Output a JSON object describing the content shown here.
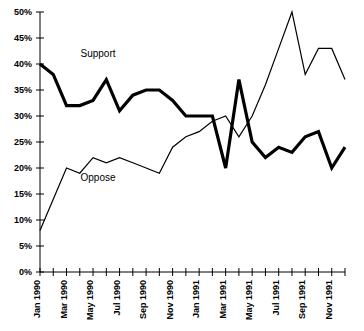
{
  "chart_data": {
    "type": "line",
    "title": "",
    "xlabel": "",
    "ylabel": "",
    "ylim": [
      0,
      50
    ],
    "ytick_values": [
      0,
      5,
      10,
      15,
      20,
      25,
      30,
      35,
      40,
      45,
      50
    ],
    "ytick_labels": [
      "0%",
      "5%",
      "10%",
      "15%",
      "20%",
      "25%",
      "30%",
      "35%",
      "40%",
      "45%",
      "50%"
    ],
    "grid": false,
    "legend_position": "inline-annotations",
    "x": [
      "Jan 1990",
      "Feb 1990",
      "Mar 1990",
      "Apr 1990",
      "May 1990",
      "Jun 1990",
      "Jul 1990",
      "Aug 1990",
      "Sep 1990",
      "Oct 1990",
      "Nov 1990",
      "Dec 1990",
      "Jan 1991",
      "Feb 1991",
      "Mar 1991",
      "Apr 1991",
      "May 1991",
      "Jun 1991",
      "Jul 1991",
      "Aug 1991",
      "Sep 1991",
      "Oct 1991",
      "Nov 1991",
      "Dec 1991"
    ],
    "xtick_labels": [
      "Jan 1990",
      "Mar 1990",
      "May 1990",
      "Jul 1990",
      "Sep 1990",
      "Nov 1990",
      "Jan 1991",
      "Mar 1991",
      "May 1991",
      "Jul 1991",
      "Sep 1991",
      "Nov 1991"
    ],
    "xtick_label_indices": [
      0,
      2,
      4,
      6,
      8,
      10,
      12,
      14,
      16,
      18,
      20,
      22
    ],
    "series": [
      {
        "name": "Support",
        "style": "thick",
        "color": "#000000",
        "values": [
          40,
          38,
          32,
          32,
          33,
          37,
          31,
          34,
          35,
          35,
          33,
          30,
          30,
          30,
          20,
          37,
          25,
          22,
          24,
          23,
          26,
          27,
          20,
          24
        ]
      },
      {
        "name": "Oppose",
        "style": "thin",
        "color": "#000000",
        "values": [
          8,
          14,
          20,
          19,
          22,
          21,
          22,
          21,
          20,
          19,
          24,
          26,
          27,
          29,
          30,
          26,
          30,
          36,
          43,
          50,
          38,
          43,
          43,
          37
        ]
      }
    ],
    "annotations": [
      {
        "text": "Support",
        "x_index": 2,
        "value": 42
      },
      {
        "text": "Oppose",
        "x_index": 2,
        "value": 18
      }
    ]
  }
}
